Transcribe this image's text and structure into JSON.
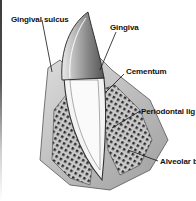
{
  "diagram": {
    "colors": {
      "ink": "#111111",
      "background": "#ffffff",
      "bone_fill": "#bdbdbd",
      "pulp_fill": "#f4f4f4",
      "enamel_fill": "#9a9a9a"
    },
    "labels": [
      {
        "id": "gingival-sulcus",
        "text": "Gingival sulcus"
      },
      {
        "id": "gingiva",
        "text": "Gingiva"
      },
      {
        "id": "cementum",
        "text": "Cementum"
      },
      {
        "id": "periodontal-ligament",
        "text": "Periodontal lig"
      },
      {
        "id": "alveolar-bone",
        "text": "Alveolar b"
      }
    ]
  }
}
